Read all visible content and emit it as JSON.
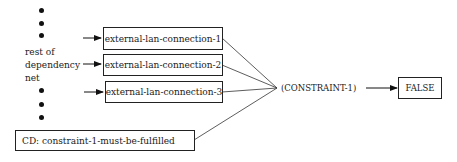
{
  "diagram": {
    "source_label": {
      "line1": "rest of",
      "line2": "dependency",
      "line3": "net"
    },
    "nodes": [
      {
        "id": "external-lan-connection-1",
        "label": "external-lan-connection-1"
      },
      {
        "id": "external-lan-connection-2",
        "label": "external-lan-connection-2"
      },
      {
        "id": "external-lan-connection-3",
        "label": "external-lan-connection-3"
      }
    ],
    "cd_box": {
      "label": "CD: constraint-1-must-be-fulfilled"
    },
    "constraint": {
      "label": "(CONSTRAINT-1)"
    },
    "result": {
      "label": "FALSE"
    },
    "edges": [
      {
        "from": "rest of dependency net",
        "to": "external-lan-connection-1"
      },
      {
        "from": "rest of dependency net",
        "to": "external-lan-connection-2"
      },
      {
        "from": "rest of dependency net",
        "to": "external-lan-connection-3"
      },
      {
        "from": "external-lan-connection-1",
        "to": "(CONSTRAINT-1)"
      },
      {
        "from": "external-lan-connection-2",
        "to": "(CONSTRAINT-1)"
      },
      {
        "from": "external-lan-connection-3",
        "to": "(CONSTRAINT-1)"
      },
      {
        "from": "CD: constraint-1-must-be-fulfilled",
        "to": "(CONSTRAINT-1)"
      },
      {
        "from": "(CONSTRAINT-1)",
        "to": "FALSE"
      }
    ],
    "colors": {
      "line": "#222222",
      "background": "#ffffff"
    }
  }
}
